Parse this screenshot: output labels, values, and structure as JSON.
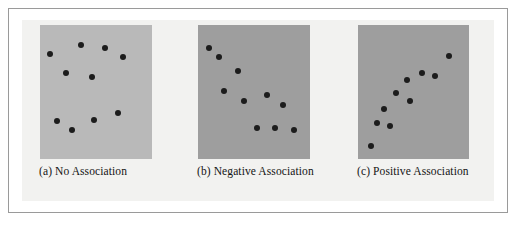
{
  "figure": {
    "background_color": "#f2f2f0",
    "border_color": "#9a9a9a",
    "page_color": "#ffffff"
  },
  "chart_data": {
    "type": "scatter",
    "title": "",
    "xlabel": "",
    "ylabel": "",
    "grid": false,
    "legend": "none",
    "xlim": [
      0,
      100
    ],
    "ylim": [
      0,
      100
    ],
    "axis_ticks": "none",
    "dot_color": "#1c1c1c",
    "panels": [
      {
        "id": "no-association",
        "caption": "(a) No Association",
        "panel_fill": "#b9b9b9",
        "n_points": 10,
        "points": [
          {
            "x": 9,
            "y": 78
          },
          {
            "x": 37,
            "y": 85
          },
          {
            "x": 58,
            "y": 83
          },
          {
            "x": 74,
            "y": 76
          },
          {
            "x": 23,
            "y": 64
          },
          {
            "x": 46,
            "y": 61
          },
          {
            "x": 15,
            "y": 28
          },
          {
            "x": 29,
            "y": 22
          },
          {
            "x": 48,
            "y": 29
          },
          {
            "x": 70,
            "y": 34
          }
        ]
      },
      {
        "id": "negative-association",
        "caption": "(b) Negative Association",
        "panel_fill": "#9e9e9e",
        "n_points": 10,
        "points": [
          {
            "x": 10,
            "y": 83
          },
          {
            "x": 19,
            "y": 76
          },
          {
            "x": 36,
            "y": 66
          },
          {
            "x": 23,
            "y": 51
          },
          {
            "x": 41,
            "y": 43
          },
          {
            "x": 62,
            "y": 48
          },
          {
            "x": 76,
            "y": 40
          },
          {
            "x": 53,
            "y": 23
          },
          {
            "x": 69,
            "y": 23
          },
          {
            "x": 86,
            "y": 22
          }
        ]
      },
      {
        "id": "positive-association",
        "caption": "(c) Positive Association",
        "panel_fill": "#9e9e9e",
        "n_points": 10,
        "points": [
          {
            "x": 12,
            "y": 10
          },
          {
            "x": 17,
            "y": 27
          },
          {
            "x": 29,
            "y": 25
          },
          {
            "x": 23,
            "y": 37
          },
          {
            "x": 34,
            "y": 49
          },
          {
            "x": 47,
            "y": 43
          },
          {
            "x": 44,
            "y": 59
          },
          {
            "x": 58,
            "y": 64
          },
          {
            "x": 69,
            "y": 62
          },
          {
            "x": 82,
            "y": 77
          }
        ]
      }
    ]
  }
}
